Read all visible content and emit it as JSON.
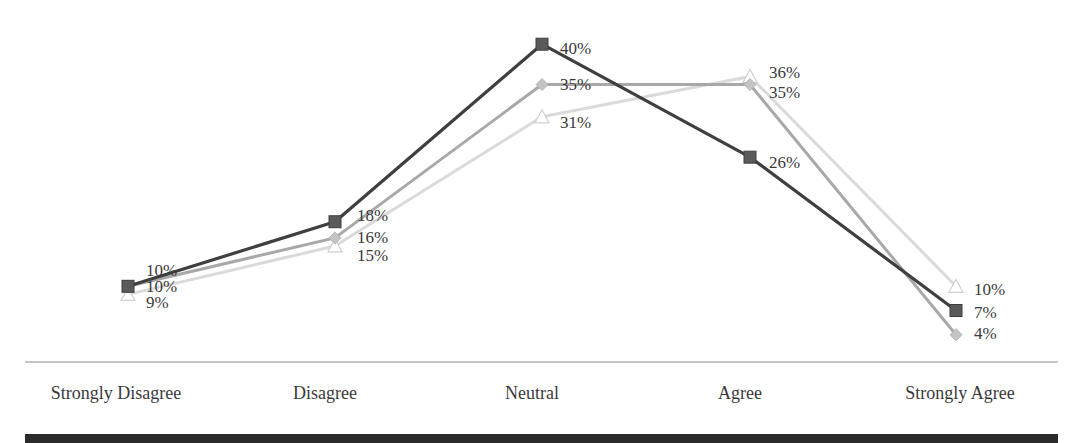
{
  "chart_data": {
    "type": "line",
    "title": "",
    "xlabel": "",
    "ylabel": "",
    "ylim": [
      0,
      45
    ],
    "grid": false,
    "legend": "none",
    "value_format": "percent",
    "categories": [
      "Strongly Disagree",
      "Disagree",
      "Neutral",
      "Agree",
      "Strongly Agree"
    ],
    "series": [
      {
        "name": "Series 1",
        "marker": "square",
        "line_color": "#3f3f3f",
        "marker_color": "#5a5a5a",
        "values": [
          10,
          18,
          40,
          26,
          7
        ]
      },
      {
        "name": "Series 2",
        "marker": "diamond",
        "line_color": "#a8a8a8",
        "marker_color": "#c4c4c4",
        "values": [
          10,
          16,
          35,
          35,
          4
        ]
      },
      {
        "name": "Series 3",
        "marker": "triangle",
        "line_color": "#dadada",
        "marker_color": "#ffffff",
        "values": [
          9,
          15,
          31,
          36,
          10
        ]
      }
    ],
    "data_labels": [
      [
        "10%",
        "18%",
        "40%",
        "26%",
        "7%"
      ],
      [
        "10%",
        "16%",
        "35%",
        "35%",
        "4%"
      ],
      [
        "9%",
        "15%",
        "31%",
        "36%",
        "10%"
      ]
    ]
  },
  "layout": {
    "x_positions": [
      128,
      335,
      542,
      750,
      956
    ],
    "y_zero": 367,
    "px_per_unit": 8.07,
    "axis_y": 362,
    "axis_x_start": 25,
    "axis_x_end": 1058,
    "category_label_y": 399,
    "label_positions": [
      [
        [
          146,
          272
        ],
        [
          357,
          217
        ],
        [
          560,
          50
        ],
        [
          769,
          164
        ],
        [
          974,
          314
        ]
      ],
      [
        [
          146,
          288
        ],
        [
          357,
          239
        ],
        [
          560,
          86
        ],
        [
          769,
          94
        ],
        [
          974,
          335
        ]
      ],
      [
        [
          146,
          304
        ],
        [
          357,
          257
        ],
        [
          560,
          124
        ],
        [
          769,
          74
        ],
        [
          974,
          291
        ]
      ]
    ]
  }
}
